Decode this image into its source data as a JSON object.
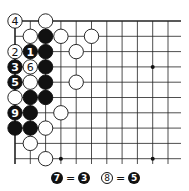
{
  "diagram": {
    "type": "go-board-corner",
    "grid": {
      "cols": 11,
      "rows": 10,
      "origin_x": 15,
      "origin_y": 21,
      "spacing": 15.3,
      "line_color": "#222222"
    },
    "edges": [
      "top",
      "left"
    ],
    "star_points": [
      [
        9,
        3
      ],
      [
        3,
        9
      ],
      [
        9,
        9
      ]
    ],
    "stones": [
      {
        "col": 0,
        "row": 0,
        "color": "white",
        "label": "4"
      },
      {
        "col": 2,
        "row": 0,
        "color": "white",
        "label": ""
      },
      {
        "col": 1,
        "row": 1,
        "color": "white",
        "label": ""
      },
      {
        "col": 2,
        "row": 1,
        "color": "black",
        "label": ""
      },
      {
        "col": 3,
        "row": 1,
        "color": "white",
        "label": ""
      },
      {
        "col": 5,
        "row": 1,
        "color": "white",
        "label": ""
      },
      {
        "col": 0,
        "row": 2,
        "color": "white",
        "label": "2"
      },
      {
        "col": 1,
        "row": 2,
        "color": "black",
        "label": "1"
      },
      {
        "col": 2,
        "row": 2,
        "color": "black",
        "label": ""
      },
      {
        "col": 4,
        "row": 2,
        "color": "white",
        "label": ""
      },
      {
        "col": 0,
        "row": 3,
        "color": "black",
        "label": "3"
      },
      {
        "col": 1,
        "row": 3,
        "color": "white",
        "label": "6"
      },
      {
        "col": 2,
        "row": 3,
        "color": "black",
        "label": ""
      },
      {
        "col": 0,
        "row": 4,
        "color": "black",
        "label": "5"
      },
      {
        "col": 1,
        "row": 4,
        "color": "white",
        "label": ""
      },
      {
        "col": 2,
        "row": 4,
        "color": "black",
        "label": ""
      },
      {
        "col": 4,
        "row": 4,
        "color": "white",
        "label": ""
      },
      {
        "col": 0,
        "row": 5,
        "color": "white",
        "label": ""
      },
      {
        "col": 1,
        "row": 5,
        "color": "black",
        "label": ""
      },
      {
        "col": 2,
        "row": 5,
        "color": "black",
        "label": ""
      },
      {
        "col": 0,
        "row": 6,
        "color": "black",
        "label": "9"
      },
      {
        "col": 1,
        "row": 6,
        "color": "black",
        "label": ""
      },
      {
        "col": 3,
        "row": 6,
        "color": "white",
        "label": ""
      },
      {
        "col": 0,
        "row": 7,
        "color": "black",
        "label": ""
      },
      {
        "col": 1,
        "row": 7,
        "color": "black",
        "label": ""
      },
      {
        "col": 2,
        "row": 7,
        "color": "white",
        "label": ""
      },
      {
        "col": 1,
        "row": 8,
        "color": "white",
        "label": ""
      },
      {
        "col": 2,
        "row": 9,
        "color": "white",
        "label": ""
      }
    ]
  },
  "caption": {
    "items": [
      {
        "left_color": "black",
        "left_label": "7",
        "eq": "=",
        "right_color": "black",
        "right_label": "3"
      },
      {
        "left_color": "white",
        "left_label": "8",
        "eq": "=",
        "right_color": "black",
        "right_label": "5"
      }
    ]
  }
}
